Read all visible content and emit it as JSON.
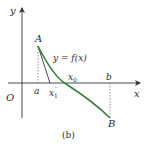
{
  "figure": {
    "caption": "(b)",
    "axes": {
      "x_label": "x",
      "y_label": "y",
      "origin_label": "O"
    },
    "points": {
      "A": "A",
      "B": "B"
    },
    "x_marks": {
      "a": "a",
      "x1_prime": "x",
      "x1_prime_sub": "1",
      "x1_prime_sup": "′",
      "x0": "x",
      "x0_sub": "0",
      "b": "b"
    },
    "curve_label": "y = f(x)",
    "colors": {
      "curve": "#3a7d3a",
      "axis": "#333333",
      "tangent": "#333333",
      "dashed": "#666666"
    }
  }
}
